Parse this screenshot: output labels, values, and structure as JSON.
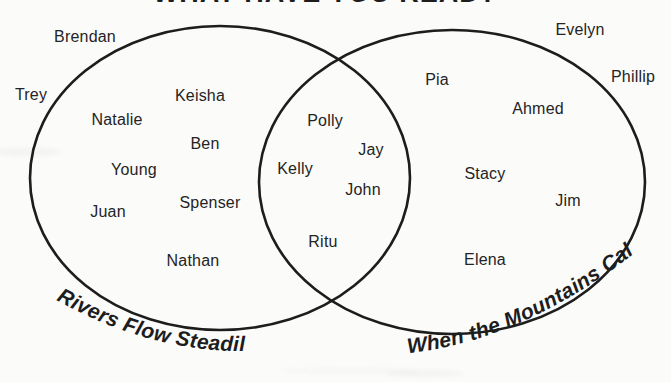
{
  "title": "WHAT HAVE YOU READ?",
  "venn": {
    "left_set_label": "Rivers Flow Steadily",
    "right_set_label": "When the Mountains Call",
    "stroke_color": "#1d1d1d",
    "text_color": "#242424",
    "background_color": "#fbfbfa",
    "names": [
      {
        "label": "Brendan",
        "region": "outside",
        "x": 85,
        "y": 37
      },
      {
        "label": "Trey",
        "region": "outside",
        "x": 31,
        "y": 95
      },
      {
        "label": "Evelyn",
        "region": "outside",
        "x": 580,
        "y": 30
      },
      {
        "label": "Phillip",
        "region": "outside",
        "x": 633,
        "y": 77
      },
      {
        "label": "Keisha",
        "region": "left-only",
        "x": 200,
        "y": 96
      },
      {
        "label": "Natalie",
        "region": "left-only",
        "x": 117,
        "y": 120
      },
      {
        "label": "Ben",
        "region": "left-only",
        "x": 205,
        "y": 144
      },
      {
        "label": "Young",
        "region": "left-only",
        "x": 134,
        "y": 170
      },
      {
        "label": "Spenser",
        "region": "left-only",
        "x": 210,
        "y": 203
      },
      {
        "label": "Juan",
        "region": "left-only",
        "x": 108,
        "y": 212
      },
      {
        "label": "Nathan",
        "region": "left-only",
        "x": 193,
        "y": 261
      },
      {
        "label": "Polly",
        "region": "intersection",
        "x": 325,
        "y": 121
      },
      {
        "label": "Jay",
        "region": "intersection",
        "x": 371,
        "y": 150
      },
      {
        "label": "Kelly",
        "region": "intersection",
        "x": 295,
        "y": 169
      },
      {
        "label": "John",
        "region": "intersection",
        "x": 363,
        "y": 190
      },
      {
        "label": "Ritu",
        "region": "intersection",
        "x": 323,
        "y": 242
      },
      {
        "label": "Pia",
        "region": "right-only",
        "x": 437,
        "y": 80
      },
      {
        "label": "Ahmed",
        "region": "right-only",
        "x": 538,
        "y": 109
      },
      {
        "label": "Stacy",
        "region": "right-only",
        "x": 485,
        "y": 174
      },
      {
        "label": "Jim",
        "region": "right-only",
        "x": 568,
        "y": 201
      },
      {
        "label": "Elena",
        "region": "right-only",
        "x": 485,
        "y": 260
      }
    ]
  }
}
